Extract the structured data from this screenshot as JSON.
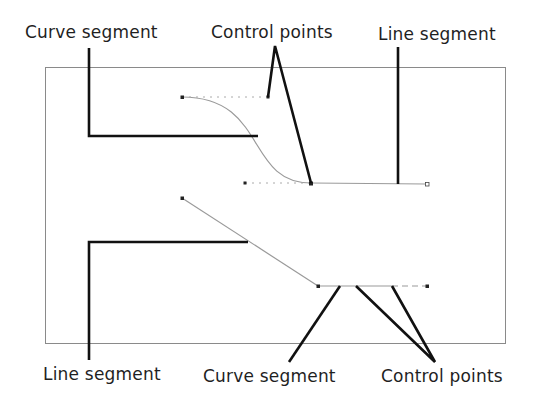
{
  "diagram": {
    "colors": {
      "frame": "#8a8a8a",
      "path": "#9a9a9a",
      "callout": "#111111",
      "label": "#1f1f1f",
      "point": "#222222"
    },
    "labels": {
      "top_left": "Curve segment",
      "top_center": "Control points",
      "top_right": "Line segment",
      "bottom_left": "Line segment",
      "bottom_center": "Curve segment",
      "bottom_right": "Control points"
    },
    "upper_path": {
      "description": "Curve segment from top-left anchor to middle anchor, followed by line segment",
      "anchors": [
        [
          182,
          97
        ],
        [
          311,
          183
        ],
        [
          427,
          184
        ]
      ],
      "handles": [
        [
          268,
          97
        ],
        [
          245,
          183
        ]
      ]
    },
    "lower_path": {
      "description": "Line segment from upper-left anchor to lower anchor, followed by curve segment with handles",
      "anchors": [
        [
          182,
          198
        ],
        [
          318,
          286
        ],
        [
          427,
          286
        ]
      ],
      "handles": [
        [
          356,
          286
        ],
        [
          392,
          286
        ]
      ]
    }
  }
}
